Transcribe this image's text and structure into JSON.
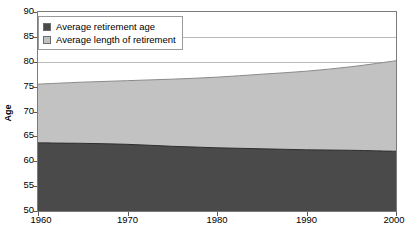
{
  "chart_data": {
    "type": "area",
    "stacked": true,
    "title": "",
    "subtitle": "",
    "xlabel": "",
    "ylabel": "Age",
    "xlim": [
      1960,
      2000
    ],
    "ylim": [
      50,
      90
    ],
    "grid": true,
    "grid_axis": "y",
    "legend_position": "top-left",
    "x": [
      1960,
      1965,
      1970,
      1975,
      1980,
      1985,
      1990,
      1995,
      2000
    ],
    "xticks": [
      1960,
      1970,
      1980,
      1990,
      2000
    ],
    "xtick_labels": [
      "1960",
      "1970",
      "1980",
      "1990",
      "2000"
    ],
    "yticks": [
      50,
      55,
      60,
      65,
      70,
      75,
      80,
      85,
      90
    ],
    "ytick_labels": [
      "50",
      "55",
      "60",
      "65",
      "70",
      "75",
      "80",
      "85",
      "90"
    ],
    "baseline": 50,
    "series": [
      {
        "name": "Average retirement age",
        "color": "#4a4a4a",
        "values": [
          63.7,
          63.6,
          63.4,
          63.0,
          62.7,
          62.5,
          62.3,
          62.2,
          62.0
        ]
      },
      {
        "name": "Average length of retirement",
        "color": "#c2c2c2",
        "values": [
          11.8,
          12.3,
          12.8,
          13.5,
          14.2,
          15.0,
          15.8,
          16.8,
          18.2
        ]
      }
    ],
    "cumulative_top": [
      75.5,
      75.9,
      76.2,
      76.5,
      76.9,
      77.5,
      78.1,
      79.0,
      80.2
    ],
    "annotations": []
  },
  "legend": {
    "items": [
      {
        "label": "Average retirement age",
        "color": "#4a4a4a"
      },
      {
        "label": "Average length of retirement",
        "color": "#c2c2c2"
      }
    ]
  },
  "axis": {
    "y_title": "Age"
  },
  "colors": {
    "series_dark": "#4a4a4a",
    "series_light": "#c2c2c2",
    "frame": "#7a7a7a",
    "grid": "#9e9e9e",
    "text": "#000000",
    "background": "#ffffff"
  }
}
